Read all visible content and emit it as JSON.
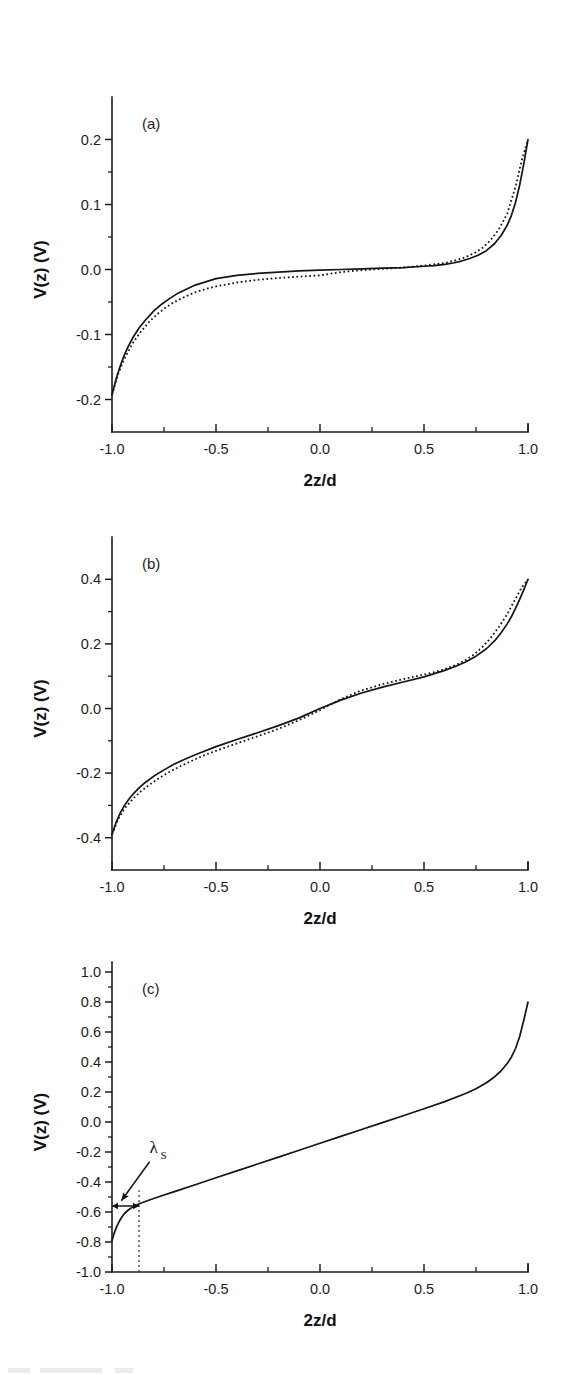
{
  "figure": {
    "background": "#ffffff",
    "ink_color": "#141414",
    "panel_count": 3
  },
  "axis_titles": {
    "x": "2z/d",
    "y": "V(z) (V)"
  },
  "panels": [
    {
      "id": "a",
      "tag": "(a)",
      "xlabel": "2z/d",
      "ylabel": "V(z) (V)",
      "xlim": [
        -1.0,
        1.0
      ],
      "ylim": [
        -0.25,
        0.25
      ],
      "xticks": [
        -1.0,
        -0.5,
        0.0,
        0.5,
        1.0
      ],
      "xticklabels": [
        "-1.0",
        "-0.5",
        "0.0",
        "0.5",
        "1.0"
      ],
      "xminor": [
        -0.75,
        -0.25,
        0.25,
        0.75
      ],
      "yticks": [
        0.2,
        0.1,
        0.0,
        -0.1,
        -0.2
      ],
      "yticklabels": [
        "0.2",
        "0.1",
        "0.0",
        "-0.1",
        "-0.2"
      ],
      "yminor": [
        0.15,
        0.05,
        -0.05,
        -0.15
      ]
    },
    {
      "id": "b",
      "tag": "(b)",
      "xlabel": "2z/d",
      "ylabel": "V(z) (V)",
      "xlim": [
        -1.0,
        1.0
      ],
      "ylim": [
        -0.5,
        0.5
      ],
      "xticks": [
        -1.0,
        -0.5,
        0.0,
        0.5,
        1.0
      ],
      "xticklabels": [
        "-1.0",
        "-0.5",
        "0.0",
        "0.5",
        "1.0"
      ],
      "xminor": [
        -0.75,
        -0.25,
        0.25,
        0.75
      ],
      "yticks": [
        0.4,
        0.2,
        0.0,
        -0.2,
        -0.4
      ],
      "yticklabels": [
        "0.4",
        "0.2",
        "0.0",
        "-0.2",
        "-0.4"
      ],
      "yminor": [
        0.3,
        0.1,
        -0.1,
        -0.3
      ]
    },
    {
      "id": "c",
      "tag": "(c)",
      "xlabel": "2z/d",
      "ylabel": "V(z) (V)",
      "xlim": [
        -1.0,
        1.0
      ],
      "ylim": [
        -1.0,
        1.0
      ],
      "xticks": [
        -1.0,
        -0.5,
        0.0,
        0.5,
        1.0
      ],
      "xticklabels": [
        "-1.0",
        "-0.5",
        "0.0",
        "0.5",
        "1.0"
      ],
      "xminor": [
        -0.75,
        -0.25,
        0.25,
        0.75
      ],
      "yticks": [
        1.0,
        0.8,
        0.6,
        0.4,
        0.2,
        0.0,
        -0.2,
        -0.4,
        -0.6,
        -0.8,
        -1.0
      ],
      "yticklabels": [
        "1.0",
        "0.8",
        "0.6",
        "0.4",
        "0.2",
        "0.0",
        "-0.2",
        "-0.4",
        "-0.6",
        "-0.8",
        "-1.0"
      ],
      "yminor": [
        0.9,
        0.7,
        0.5,
        0.3,
        0.1,
        -0.1,
        -0.3,
        -0.5,
        -0.7,
        -0.9
      ]
    }
  ],
  "annotations": {
    "lambda_s": {
      "label": "λ",
      "subscript": "S",
      "arrow_tip_x": -0.955,
      "arrow_tip_y": -0.525,
      "label_x": -0.8,
      "label_y": -0.205,
      "bar_y": -0.56,
      "bar_x_start": -1.0,
      "bar_x_end": -0.87,
      "guide_x": -0.87,
      "guide_y_bottom": -1.0,
      "guide_y_top": -0.455,
      "panel": "c"
    }
  },
  "chart_data": [
    {
      "type": "line",
      "panel": "a",
      "title": "(a)",
      "xlabel": "2z/d",
      "ylabel": "V(z) (V)",
      "xlim": [
        -1.0,
        1.0
      ],
      "ylim": [
        -0.25,
        0.25
      ],
      "grid": false,
      "legend": "none",
      "series": [
        {
          "name": "solid",
          "style": "solid",
          "x": [
            -1.0,
            -0.98,
            -0.96,
            -0.94,
            -0.92,
            -0.9,
            -0.87,
            -0.84,
            -0.8,
            -0.76,
            -0.72,
            -0.68,
            -0.64,
            -0.6,
            -0.55,
            -0.5,
            -0.4,
            -0.3,
            -0.2,
            -0.1,
            0.0,
            0.1,
            0.2,
            0.3,
            0.4,
            0.5,
            0.55,
            0.6,
            0.64,
            0.68,
            0.72,
            0.76,
            0.8,
            0.84,
            0.87,
            0.9,
            0.92,
            0.94,
            0.96,
            0.98,
            1.0
          ],
          "y": [
            -0.193,
            -0.168,
            -0.148,
            -0.131,
            -0.117,
            -0.105,
            -0.09,
            -0.078,
            -0.064,
            -0.053,
            -0.044,
            -0.036,
            -0.03,
            -0.024,
            -0.019,
            -0.014,
            -0.009,
            -0.006,
            -0.004,
            -0.002,
            -0.001,
            0.0,
            0.001,
            0.002,
            0.003,
            0.005,
            0.006,
            0.008,
            0.01,
            0.013,
            0.017,
            0.022,
            0.029,
            0.04,
            0.052,
            0.068,
            0.083,
            0.103,
            0.13,
            0.163,
            0.2
          ]
        },
        {
          "name": "dotted",
          "style": "dotted",
          "x": [
            -1.0,
            -0.97,
            -0.94,
            -0.9,
            -0.86,
            -0.82,
            -0.78,
            -0.74,
            -0.7,
            -0.65,
            -0.6,
            -0.55,
            -0.5,
            -0.4,
            -0.3,
            -0.2,
            -0.1,
            0.0,
            0.1,
            0.2,
            0.3,
            0.4,
            0.5,
            0.55,
            0.6,
            0.65,
            0.7,
            0.74,
            0.78,
            0.82,
            0.86,
            0.9,
            0.94,
            0.97,
            1.0
          ],
          "y": [
            -0.193,
            -0.16,
            -0.137,
            -0.113,
            -0.095,
            -0.08,
            -0.068,
            -0.058,
            -0.05,
            -0.042,
            -0.035,
            -0.03,
            -0.026,
            -0.02,
            -0.016,
            -0.013,
            -0.011,
            -0.009,
            -0.004,
            -0.001,
            0.001,
            0.003,
            0.006,
            0.008,
            0.01,
            0.014,
            0.019,
            0.025,
            0.033,
            0.045,
            0.062,
            0.086,
            0.127,
            0.168,
            0.2
          ]
        }
      ]
    },
    {
      "type": "line",
      "panel": "b",
      "title": "(b)",
      "xlabel": "2z/d",
      "ylabel": "V(z) (V)",
      "xlim": [
        -1.0,
        1.0
      ],
      "ylim": [
        -0.5,
        0.5
      ],
      "grid": false,
      "legend": "none",
      "series": [
        {
          "name": "solid",
          "style": "solid",
          "x": [
            -1.0,
            -0.98,
            -0.96,
            -0.94,
            -0.92,
            -0.9,
            -0.87,
            -0.84,
            -0.8,
            -0.75,
            -0.7,
            -0.65,
            -0.6,
            -0.5,
            -0.4,
            -0.3,
            -0.2,
            -0.1,
            0.0,
            0.1,
            0.2,
            0.3,
            0.4,
            0.5,
            0.6,
            0.65,
            0.7,
            0.75,
            0.8,
            0.84,
            0.87,
            0.9,
            0.92,
            0.94,
            0.96,
            0.98,
            1.0
          ],
          "y": [
            -0.39,
            -0.352,
            -0.323,
            -0.3,
            -0.282,
            -0.266,
            -0.246,
            -0.229,
            -0.21,
            -0.19,
            -0.172,
            -0.157,
            -0.143,
            -0.118,
            -0.096,
            -0.075,
            -0.053,
            -0.029,
            0.0,
            0.026,
            0.048,
            0.066,
            0.082,
            0.098,
            0.118,
            0.13,
            0.144,
            0.162,
            0.185,
            0.21,
            0.234,
            0.262,
            0.284,
            0.31,
            0.338,
            0.368,
            0.4
          ]
        },
        {
          "name": "dotted",
          "style": "dotted",
          "x": [
            -1.0,
            -0.97,
            -0.94,
            -0.9,
            -0.86,
            -0.82,
            -0.78,
            -0.74,
            -0.7,
            -0.65,
            -0.6,
            -0.55,
            -0.5,
            -0.4,
            -0.3,
            -0.2,
            -0.1,
            0.0,
            0.1,
            0.2,
            0.3,
            0.4,
            0.5,
            0.55,
            0.6,
            0.65,
            0.7,
            0.74,
            0.78,
            0.82,
            0.86,
            0.9,
            0.94,
            0.97,
            1.0
          ],
          "y": [
            -0.39,
            -0.342,
            -0.31,
            -0.28,
            -0.256,
            -0.236,
            -0.218,
            -0.202,
            -0.188,
            -0.172,
            -0.157,
            -0.143,
            -0.131,
            -0.108,
            -0.086,
            -0.063,
            -0.036,
            -0.005,
            0.029,
            0.056,
            0.075,
            0.091,
            0.105,
            0.113,
            0.122,
            0.134,
            0.15,
            0.167,
            0.19,
            0.218,
            0.252,
            0.292,
            0.34,
            0.375,
            0.4
          ]
        }
      ]
    },
    {
      "type": "line",
      "panel": "c",
      "title": "(c)",
      "xlabel": "2z/d",
      "ylabel": "V(z) (V)",
      "xlim": [
        -1.0,
        1.0
      ],
      "ylim": [
        -1.0,
        1.0
      ],
      "grid": false,
      "legend": "none",
      "annotation": "lambda_S",
      "series": [
        {
          "name": "solid",
          "style": "solid",
          "x": [
            -1.0,
            -0.99,
            -0.98,
            -0.97,
            -0.96,
            -0.95,
            -0.94,
            -0.92,
            -0.9,
            -0.88,
            -0.86,
            -0.84,
            -0.8,
            -0.75,
            -0.7,
            -0.6,
            -0.5,
            -0.4,
            -0.3,
            -0.2,
            -0.1,
            0.0,
            0.1,
            0.2,
            0.3,
            0.4,
            0.5,
            0.6,
            0.7,
            0.75,
            0.8,
            0.84,
            0.87,
            0.9,
            0.92,
            0.94,
            0.96,
            0.98,
            1.0
          ],
          "y": [
            -0.79,
            -0.744,
            -0.706,
            -0.676,
            -0.65,
            -0.628,
            -0.61,
            -0.585,
            -0.566,
            -0.552,
            -0.54,
            -0.53,
            -0.51,
            -0.487,
            -0.464,
            -0.418,
            -0.372,
            -0.326,
            -0.28,
            -0.234,
            -0.188,
            -0.142,
            -0.096,
            -0.05,
            -0.004,
            0.042,
            0.088,
            0.136,
            0.19,
            0.222,
            0.262,
            0.302,
            0.34,
            0.39,
            0.432,
            0.49,
            0.57,
            0.68,
            0.8
          ]
        }
      ]
    }
  ]
}
